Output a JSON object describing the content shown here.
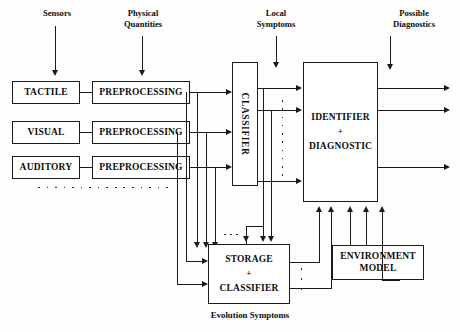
{
  "diagram": {
    "captions": {
      "sensors": "Sensors",
      "physical_quantities_l1": "Physical",
      "physical_quantities_l2": "Quantities",
      "local_symptoms_l1": "Local",
      "local_symptoms_l2": "Symptoms",
      "possible_diagnostics_l1": "Possible",
      "possible_diagnostics_l2": "Diagnostics",
      "evolution_symptoms": "Evolution Symptoms"
    },
    "blocks": {
      "tactile": "TACTILE",
      "visual": "VISUAL",
      "auditory": "AUDITORY",
      "preprocessing_1": "PREPROCESSING",
      "preprocessing_2": "PREPROCESSING",
      "preprocessing_3": "PREPROCESSING",
      "classifier": "CLASSIFIER",
      "identifier": "IDENTIFIER",
      "identifier_plus": "+",
      "diagnostic": "DIAGNOSTIC",
      "storage": "STORAGE",
      "storage_plus": "+",
      "storage_classifier": "CLASSIFIER",
      "environment_model_l1": "ENVIRONMENT",
      "environment_model_l2": "MODEL"
    },
    "colors": {
      "ink": "#1a1a1a",
      "paper": "#fefefe"
    }
  }
}
